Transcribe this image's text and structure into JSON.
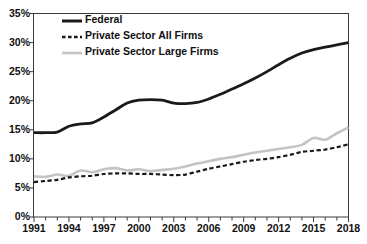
{
  "chart_data": {
    "type": "line",
    "title": "",
    "xlabel": "",
    "ylabel": "",
    "xlim": [
      1991,
      2018
    ],
    "ylim": [
      0,
      35
    ],
    "grid": false,
    "legend_position": "top-left-inside",
    "y_tick_labels": [
      "35%",
      "30%",
      "25%",
      "20%",
      "15%",
      "10%",
      "5%",
      "0%"
    ],
    "y_tick_values": [
      35,
      30,
      25,
      20,
      15,
      10,
      5,
      0
    ],
    "x_tick_labels": [
      "1991",
      "1994",
      "1997",
      "2000",
      "2003",
      "2006",
      "2009",
      "2012",
      "2015",
      "2018"
    ],
    "x_tick_values": [
      1991,
      1994,
      1997,
      2000,
      2003,
      2006,
      2009,
      2012,
      2015,
      2018
    ],
    "x_minor_ticks": [
      1991,
      1992,
      1993,
      1994,
      1995,
      1996,
      1997,
      1998,
      1999,
      2000,
      2001,
      2002,
      2003,
      2004,
      2005,
      2006,
      2007,
      2008,
      2009,
      2010,
      2011,
      2012,
      2013,
      2014,
      2015,
      2016,
      2017,
      2018
    ],
    "x": [
      1991,
      1992,
      1993,
      1994,
      1995,
      1996,
      1997,
      1998,
      1999,
      2000,
      2001,
      2002,
      2003,
      2004,
      2005,
      2006,
      2007,
      2008,
      2009,
      2010,
      2011,
      2012,
      2013,
      2014,
      2015,
      2016,
      2017,
      2018
    ],
    "series": [
      {
        "name": "Federal",
        "color": "#1a1a1a",
        "style": "solid",
        "values": [
          14.5,
          14.5,
          14.6,
          15.6,
          16.0,
          16.2,
          17.2,
          18.4,
          19.6,
          20.1,
          20.2,
          20.1,
          19.6,
          19.5,
          19.7,
          20.3,
          21.1,
          22.0,
          22.9,
          23.9,
          25.0,
          26.2,
          27.3,
          28.2,
          28.8,
          29.2,
          29.6,
          30.0
        ]
      },
      {
        "name": "Private Sector All Firms",
        "color": "#1a1a1a",
        "style": "dashed",
        "values": [
          6.0,
          6.2,
          6.4,
          6.8,
          7.0,
          7.1,
          7.4,
          7.5,
          7.5,
          7.4,
          7.4,
          7.3,
          7.2,
          7.3,
          7.8,
          8.3,
          8.7,
          9.1,
          9.5,
          9.8,
          10.0,
          10.3,
          10.7,
          11.2,
          11.4,
          11.6,
          12.0,
          12.5
        ]
      },
      {
        "name": "Private Sector Large Firms",
        "color": "#c4c4c4",
        "style": "solid",
        "values": [
          7.0,
          6.9,
          7.3,
          7.1,
          8.0,
          7.7,
          8.2,
          8.4,
          8.0,
          8.2,
          7.9,
          8.1,
          8.3,
          8.7,
          9.2,
          9.6,
          10.0,
          10.3,
          10.7,
          11.1,
          11.4,
          11.7,
          12.0,
          12.4,
          13.6,
          13.3,
          14.4,
          15.4
        ]
      }
    ]
  },
  "legend": {
    "items": [
      {
        "label": "Federal",
        "style": "solid",
        "color": "#1a1a1a"
      },
      {
        "label": "Private Sector All Firms",
        "style": "dashed",
        "color": "#1a1a1a"
      },
      {
        "label": "Private Sector Large Firms",
        "style": "solid",
        "color": "#c4c4c4"
      }
    ]
  }
}
